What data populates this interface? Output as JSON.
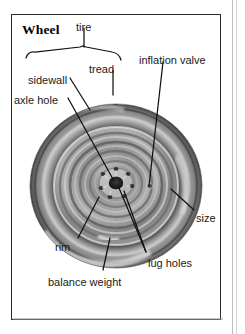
{
  "figure": {
    "title": "Wheel",
    "kind": "labeled-photo-diagram",
    "frame": {
      "border_color": "#2b2b2b",
      "background": "#ffffff"
    },
    "photo": {
      "description": "grayscale photograph of a car wheel: dark rubber tire ring enclosing a light metal rim with concentric ribs, a dark central axle hole and a ring of lug holes",
      "tire_color": "#4a4a4a",
      "tire_highlight_color": "#cfcfcf",
      "rim_color": "#8e8e8e",
      "rim_light_color": "#d8d8d8",
      "hub_color": "#1c1c1c",
      "center_x": 116,
      "center_y": 186,
      "outer_radius": 86
    },
    "labels": [
      {
        "id": "tire",
        "text": "tire",
        "x": 76,
        "y": 22
      },
      {
        "id": "tread",
        "text": "tread",
        "x": 89,
        "y": 64
      },
      {
        "id": "sidewall",
        "text": "sidewall",
        "x": 28,
        "y": 75
      },
      {
        "id": "inflation-valve",
        "text": "inflation valve",
        "x": 139,
        "y": 55
      },
      {
        "id": "axle-hole",
        "text": "axle hole",
        "x": 14,
        "y": 95
      },
      {
        "id": "size",
        "text": "size",
        "x": 196,
        "y": 213
      },
      {
        "id": "rim",
        "text": "rim",
        "x": 55,
        "y": 242
      },
      {
        "id": "lug-holes",
        "text": "lug holes",
        "x": 148,
        "y": 258
      },
      {
        "id": "balance-weight",
        "text": "balance weight",
        "x": 48,
        "y": 277
      }
    ],
    "leader_color": "#111111"
  }
}
